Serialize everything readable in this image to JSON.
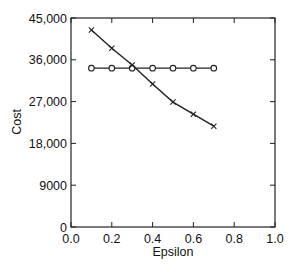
{
  "chart_data": {
    "type": "line",
    "title": "",
    "xlabel": "Epsilon",
    "ylabel": "Cost",
    "xlim": [
      0.0,
      1.0
    ],
    "ylim": [
      0,
      45000
    ],
    "xticks": [
      0.0,
      0.2,
      0.4,
      0.6,
      0.8,
      1.0
    ],
    "xtick_labels": [
      "0.0",
      "0.2",
      "0.4",
      "0.6",
      "0.8",
      "1.0"
    ],
    "yticks": [
      0,
      9000,
      18000,
      27000,
      36000,
      45000
    ],
    "ytick_labels": [
      "0",
      "9000",
      "18,000",
      "27,000",
      "36,000",
      "45,000"
    ],
    "grid": false,
    "legend": null,
    "x": [
      0.1,
      0.2,
      0.3,
      0.4,
      0.5,
      0.6,
      0.7
    ],
    "series": [
      {
        "name": "circle-series",
        "marker": "o",
        "values": [
          34200,
          34200,
          34200,
          34200,
          34200,
          34200,
          34200
        ]
      },
      {
        "name": "cross-series",
        "marker": "x",
        "values": [
          42400,
          38500,
          34900,
          30800,
          26900,
          24300,
          21700
        ]
      }
    ]
  }
}
